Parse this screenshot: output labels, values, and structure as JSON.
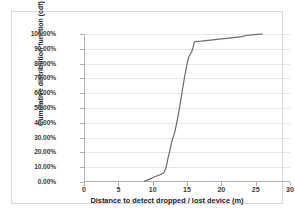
{
  "figure": {
    "background_color": "#ffffff",
    "frame_color": "#d8d8d8",
    "axis_color": "#b0b0b0",
    "gridline_color": "#e6e6e6"
  },
  "chart_data": {
    "type": "line",
    "title": "",
    "subtitle": "",
    "xlabel": "Distance to detect dropped / lost device (m)",
    "ylabel": "Cumulative distribution function (cdf)",
    "xlim": [
      0,
      30
    ],
    "ylim": [
      0,
      1
    ],
    "xticks": [
      0,
      5,
      10,
      15,
      20,
      25,
      30
    ],
    "xtick_labels": [
      "0",
      "5",
      "10",
      "15",
      "20",
      "25",
      "30"
    ],
    "yticks": [
      0,
      0.1,
      0.2,
      0.3,
      0.4,
      0.5,
      0.6,
      0.7,
      0.8,
      0.9,
      1.0
    ],
    "ytick_labels": [
      "0.00%",
      "10.00%",
      "20.00%",
      "30.00%",
      "40.00%",
      "50.00%",
      "60.00%",
      "70.00%",
      "80.00%",
      "90.00%",
      "100.00%"
    ],
    "grid": "horizontal",
    "legend": "none",
    "series": [
      {
        "name": "cdf",
        "color": "#6b6b6b",
        "line_width": 1.2,
        "x": [
          8.7,
          9.2,
          9.7,
          10.1,
          10.5,
          10.9,
          11.2,
          11.5,
          11.8,
          12.0,
          12.2,
          12.4,
          12.6,
          12.8,
          13.0,
          13.2,
          13.4,
          13.6,
          13.8,
          14.0,
          14.2,
          14.4,
          14.6,
          14.8,
          15.0,
          15.2,
          15.4,
          15.6,
          15.8,
          16.0,
          16.3,
          17.0,
          18.0,
          19.0,
          20.0,
          21.0,
          22.0,
          23.0,
          23.6,
          24.4,
          25.2,
          26.0
        ],
        "y": [
          0.0,
          0.008,
          0.018,
          0.027,
          0.034,
          0.041,
          0.047,
          0.055,
          0.08,
          0.12,
          0.165,
          0.205,
          0.245,
          0.285,
          0.31,
          0.345,
          0.39,
          0.44,
          0.49,
          0.545,
          0.605,
          0.66,
          0.715,
          0.765,
          0.81,
          0.845,
          0.862,
          0.878,
          0.905,
          0.945,
          0.95,
          0.952,
          0.957,
          0.962,
          0.967,
          0.972,
          0.977,
          0.982,
          0.99,
          0.994,
          0.998,
          1.0
        ]
      }
    ]
  }
}
